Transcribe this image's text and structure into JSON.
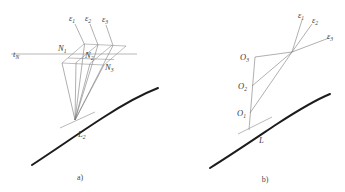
{
  "figure": {
    "background_color": "#ffffff",
    "line_color": "#8a8a8a",
    "curve_color": "#1c1c1c",
    "label_color": "#3a3a3a"
  },
  "panel_a": {
    "caption": "a)",
    "axis_label": "t",
    "axis_label_sub": "N",
    "plane_labels": [
      {
        "base": "N",
        "sub": "1"
      },
      {
        "base": "N",
        "sub": "2"
      },
      {
        "base": "N",
        "sub": "3"
      }
    ],
    "ray_labels": [
      {
        "base": "ε",
        "sub": "1"
      },
      {
        "base": "ε",
        "sub": "2"
      },
      {
        "base": "ε",
        "sub": "3"
      }
    ],
    "curve_label": {
      "base": "L",
      "sub": "2"
    }
  },
  "panel_b": {
    "caption": "b)",
    "point_labels": [
      {
        "base": "O",
        "sub": "3"
      },
      {
        "base": "O",
        "sub": "2"
      },
      {
        "base": "O",
        "sub": "1"
      }
    ],
    "ray_labels": [
      {
        "base": "ε",
        "sub": "1"
      },
      {
        "base": "ε",
        "sub": "2"
      },
      {
        "base": "ε",
        "sub": "3"
      }
    ],
    "curve_label": {
      "base": "L",
      "sub": ""
    }
  }
}
